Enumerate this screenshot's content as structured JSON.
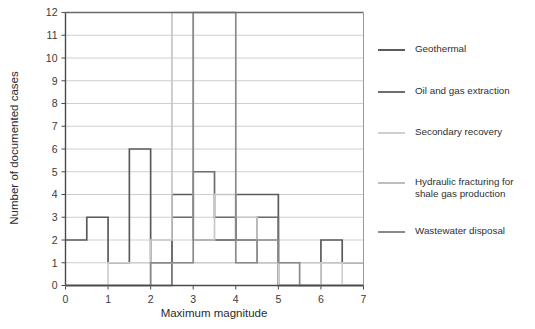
{
  "chart_data": {
    "type": "line",
    "title": "",
    "xlabel": "Maximum magnitude",
    "ylabel": "Number of documented cases",
    "xlim": [
      0,
      7
    ],
    "ylim": [
      0,
      12
    ],
    "xticks": [
      "0",
      "1",
      "2",
      "3",
      "4",
      "5",
      "6",
      "7"
    ],
    "yticks": [
      "0",
      "1",
      "2",
      "3",
      "4",
      "5",
      "6",
      "7",
      "8",
      "9",
      "10",
      "11",
      "12"
    ],
    "grid": "horizontal",
    "bin_width": 0.5,
    "bin_edges": [
      0,
      0.5,
      1,
      1.5,
      2,
      2.5,
      3,
      3.5,
      4,
      4.5,
      5,
      5.5,
      6,
      6.5,
      7
    ],
    "legend_position": "right",
    "series": [
      {
        "name": "Geothermal",
        "color": "#5b5b5b",
        "values": [
          2,
          3,
          1,
          6,
          1,
          4,
          2,
          2,
          4,
          4,
          0,
          0,
          2,
          1
        ]
      },
      {
        "name": "Oil and gas extraction",
        "color": "#6e6e6e",
        "values": [
          0,
          0,
          0,
          0,
          0,
          3,
          5,
          3,
          2,
          3,
          0,
          0,
          0,
          0
        ]
      },
      {
        "name": "Secondary recovery",
        "color": "#cfcfcf",
        "values": [
          0,
          0,
          1,
          1,
          1,
          1,
          1,
          1,
          1,
          1,
          0,
          0,
          1,
          0
        ]
      },
      {
        "name": "Hydraulic fracturing for shale gas production",
        "color": "#c6c6c6",
        "values": [
          0,
          0,
          0,
          0,
          2,
          12,
          2,
          4,
          3,
          1,
          1,
          1,
          1,
          1
        ]
      },
      {
        "name": "Wastewater disposal",
        "color": "#8a8a8a",
        "values": [
          0,
          0,
          0,
          0,
          1,
          1,
          12,
          12,
          1,
          2,
          1,
          0,
          0,
          0
        ]
      }
    ]
  },
  "legend": {
    "items": [
      {
        "label": "Geothermal",
        "color": "#5b5b5b"
      },
      {
        "label": "Oil and gas extraction",
        "color": "#6e6e6e"
      },
      {
        "label": "Secondary recovery",
        "color": "#cfcfcf"
      },
      {
        "label": "Hydraulic fracturing for\nshale gas production",
        "color": "#bdbdbd"
      },
      {
        "label": "Wastewater disposal",
        "color": "#8a8a8a"
      }
    ]
  },
  "axes": {
    "x_title": "Maximum magnitude",
    "y_title": "Number of documented cases"
  },
  "colors": {
    "axis": "#4a4a4a",
    "grid": "#c9c9c9",
    "text": "#2b2b2b",
    "background": "#ffffff"
  }
}
